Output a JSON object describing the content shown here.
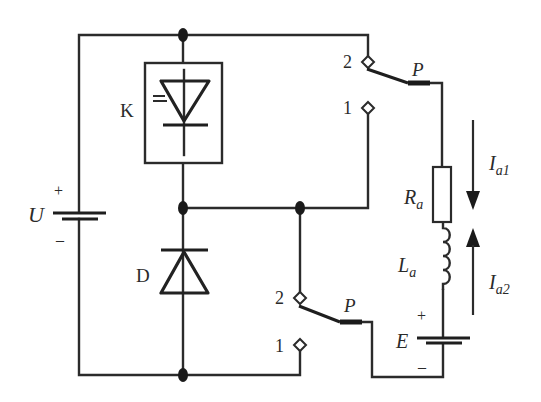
{
  "diagram": {
    "type": "circuit-schematic",
    "colors": {
      "line": "#2b2b2b",
      "background": "#ffffff"
    },
    "components": {
      "source_U": {
        "label": "U",
        "plus": "+",
        "minus": "–"
      },
      "thyristor_K": {
        "label": "K"
      },
      "diode_D": {
        "label": "D"
      },
      "resistor": {
        "label_main": "R",
        "label_sub": "a"
      },
      "inductor": {
        "label_main": "L",
        "label_sub": "a"
      },
      "source_E": {
        "label": "E",
        "plus": "+",
        "minus": "–"
      },
      "switch_top": {
        "label": "P",
        "terminal_2": "2",
        "terminal_1": "1"
      },
      "switch_bottom": {
        "label": "P",
        "terminal_2": "2",
        "terminal_1": "1"
      }
    },
    "currents": [
      {
        "label_main": "I",
        "label_sub": "a1",
        "direction": "down"
      },
      {
        "label_main": "I",
        "label_sub": "a2",
        "direction": "up"
      }
    ]
  }
}
